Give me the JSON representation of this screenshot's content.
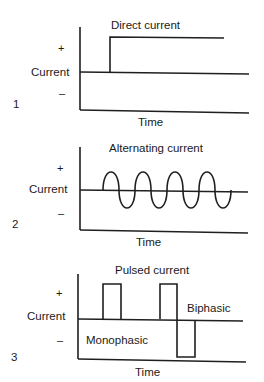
{
  "figure": {
    "panels": [
      {
        "number": "1",
        "title": "Direct current",
        "ylabel": "Current",
        "plus": "+",
        "minus": "–",
        "xlabel": "Time"
      },
      {
        "number": "2",
        "title": "Alternating current",
        "ylabel": "Current",
        "plus": "+",
        "minus": "–",
        "xlabel": "Time"
      },
      {
        "number": "3",
        "title": "Pulsed current",
        "ylabel": "Current",
        "plus": "+",
        "minus": "–",
        "xlabel": "Time",
        "annotations": {
          "monophasic": "Monophasic",
          "biphasic": "Biphasic"
        }
      }
    ],
    "colors": {
      "line": "#1f1f1f",
      "text": "#1a1a1a",
      "background": "#ffffff"
    }
  }
}
